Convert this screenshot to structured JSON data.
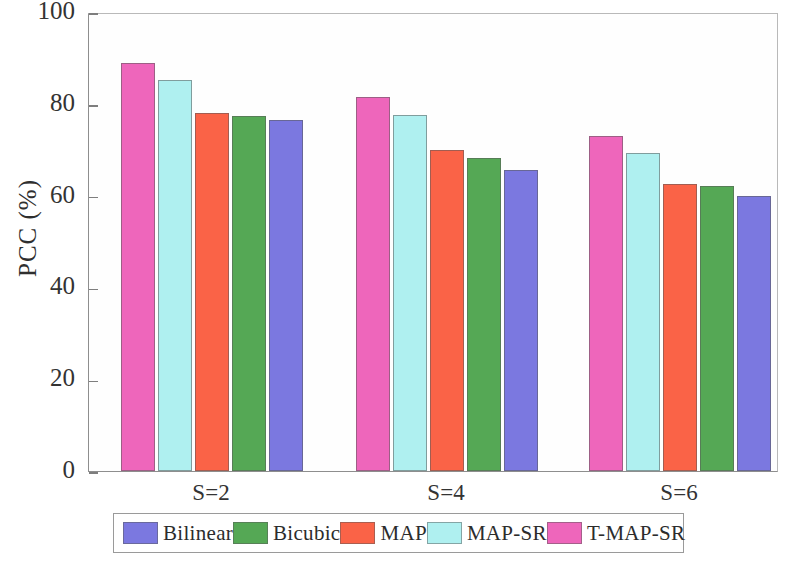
{
  "chart_data": {
    "type": "bar",
    "title": "",
    "xlabel": "",
    "ylabel": "PCC (%)",
    "categories": [
      "S=2",
      "S=4",
      "S=6"
    ],
    "ylim": [
      0,
      100
    ],
    "yticks": [
      0,
      20,
      40,
      60,
      80,
      100
    ],
    "ytick_labels": [
      "0",
      "20",
      "40",
      "60",
      "80",
      "100"
    ],
    "grid": false,
    "legend_position": "below-axes",
    "bar_draw_order": [
      "T-MAP-SR",
      "MAP-SR",
      "MAP",
      "Bicubic",
      "Bilinear"
    ],
    "series": [
      {
        "name": "Bilinear",
        "color": "#7b78e0",
        "values": [
          76.5,
          65.5,
          60.0
        ]
      },
      {
        "name": "Bicubic",
        "color": "#55a855",
        "values": [
          77.3,
          68.2,
          62.0
        ]
      },
      {
        "name": "MAP",
        "color": "#fa6347",
        "values": [
          78.0,
          70.0,
          62.5
        ]
      },
      {
        "name": "MAP-SR",
        "color": "#aff0f0",
        "values": [
          85.2,
          77.6,
          69.3
        ]
      },
      {
        "name": "T-MAP-SR",
        "color": "#ee66bb",
        "values": [
          88.8,
          81.5,
          73.0
        ]
      }
    ]
  },
  "legend": {
    "entries": [
      {
        "label": "Bilinear",
        "color": "#7b78e0"
      },
      {
        "label": "Bicubic",
        "color": "#55a855"
      },
      {
        "label": "MAP",
        "color": "#fa6347"
      },
      {
        "label": "MAP-SR",
        "color": "#aff0f0"
      },
      {
        "label": "T-MAP-SR",
        "color": "#ee66bb"
      }
    ]
  }
}
